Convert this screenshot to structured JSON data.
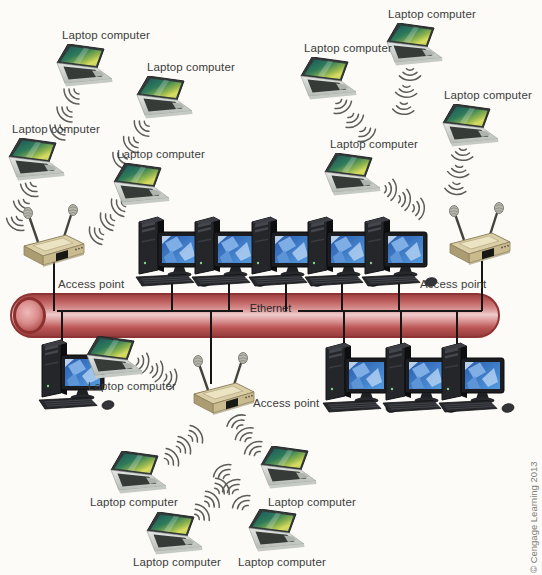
{
  "canvas": {
    "width": 542,
    "height": 575,
    "background": "#fcfbf8"
  },
  "labels": {
    "laptop": "Laptop computer",
    "access_point": "Access point",
    "ethernet": "Ethernet",
    "copyright": "© Cengage Learning 2013"
  },
  "colors": {
    "pipe_red": "#b24a4a",
    "pipe_border": "#8e3434",
    "line_black": "#161616",
    "label_text": "#3b3b3b",
    "copyright_text": "#7d7d78",
    "laptop_screen_teal": "#2f7b59",
    "monitor_screen_blue": "#3a74c4",
    "access_point_beige": "#dbcfa8"
  },
  "diagram": {
    "laptops": [
      {
        "x": 56,
        "y": 44,
        "label_x": 62,
        "label_y": 29,
        "ripples": [
          [
            58,
            86,
            180
          ],
          [
            51,
            104,
            180
          ],
          [
            44,
            122,
            180
          ]
        ]
      },
      {
        "x": 136,
        "y": 76,
        "label_x": 147,
        "label_y": 61,
        "ripples": [
          [
            128,
            118,
            182
          ],
          [
            117,
            134,
            184
          ],
          [
            106,
            150,
            186
          ]
        ]
      },
      {
        "x": 8,
        "y": 138,
        "label_x": 12,
        "label_y": 123,
        "ripples": [
          [
            16,
            180,
            170
          ],
          [
            9,
            197,
            170
          ],
          [
            2,
            214,
            170
          ]
        ]
      },
      {
        "x": 113,
        "y": 163,
        "label_x": 117,
        "label_y": 148,
        "ripples": [
          [
            104,
            197,
            190
          ],
          [
            93,
            211,
            190
          ],
          [
            82,
            225,
            190
          ]
        ]
      },
      {
        "x": 386,
        "y": 23,
        "label_x": 388,
        "label_y": 8,
        "ripples": [
          [
            398,
            66,
            135
          ],
          [
            394,
            83,
            138
          ],
          [
            391,
            100,
            140
          ]
        ]
      },
      {
        "x": 300,
        "y": 57,
        "label_x": 304,
        "label_y": 42,
        "ripples": [
          [
            332,
            97,
            100
          ],
          [
            344,
            111,
            100
          ],
          [
            356,
            125,
            100
          ]
        ]
      },
      {
        "x": 442,
        "y": 104,
        "label_x": 444,
        "label_y": 89,
        "ripples": [
          [
            450,
            146,
            140
          ],
          [
            446,
            163,
            142
          ],
          [
            443,
            180,
            144
          ]
        ]
      },
      {
        "x": 324,
        "y": 153,
        "label_x": 330,
        "label_y": 138,
        "ripples": [
          [
            382,
            178,
            50
          ],
          [
            396,
            188,
            50
          ],
          [
            410,
            197,
            50
          ]
        ]
      },
      {
        "x": 86,
        "y": 336,
        "label_x": 88,
        "label_y": 380,
        "ripples": [
          [
            134,
            352,
            60
          ],
          [
            148,
            360,
            60
          ],
          [
            162,
            368,
            60
          ]
        ]
      },
      {
        "x": 110,
        "y": 451,
        "label_x": 90,
        "label_y": 496,
        "ripples": [
          [
            162,
            444,
            10
          ],
          [
            174,
            432,
            10
          ],
          [
            186,
            421,
            10
          ]
        ]
      },
      {
        "x": 146,
        "y": 512,
        "label_x": 133,
        "label_y": 556,
        "ripples": [
          [
            192,
            499,
            5
          ],
          [
            202,
            486,
            5
          ],
          [
            212,
            473,
            5
          ]
        ]
      },
      {
        "x": 248,
        "y": 509,
        "label_x": 238,
        "label_y": 556,
        "ripples": [
          [
            228,
            488,
            280
          ],
          [
            218,
            472,
            280
          ],
          [
            209,
            457,
            280
          ]
        ]
      },
      {
        "x": 260,
        "y": 446,
        "label_x": 268,
        "label_y": 496,
        "ripples": [
          [
            240,
            434,
            280
          ],
          [
            231,
            420,
            282
          ],
          [
            223,
            407,
            284
          ]
        ]
      }
    ],
    "access_points": [
      {
        "x": 18,
        "y": 204,
        "label_x": 58,
        "label_y": 278
      },
      {
        "x": 444,
        "y": 202,
        "label_x": 420,
        "label_y": 278
      },
      {
        "x": 188,
        "y": 352,
        "label_x": 253,
        "label_y": 397
      }
    ],
    "desktops": [
      {
        "x": 133,
        "y": 213
      },
      {
        "x": 189,
        "y": 213
      },
      {
        "x": 246,
        "y": 213
      },
      {
        "x": 302,
        "y": 213
      },
      {
        "x": 359,
        "y": 213
      },
      {
        "x": 36,
        "y": 336
      },
      {
        "x": 320,
        "y": 339
      },
      {
        "x": 380,
        "y": 339
      },
      {
        "x": 436,
        "y": 339
      }
    ],
    "connectors": [
      {
        "x": 54,
        "y1": 262,
        "y2": 311
      },
      {
        "x": 482,
        "y1": 261,
        "y2": 311
      },
      {
        "x": 172,
        "y1": 283,
        "y2": 311
      },
      {
        "x": 229,
        "y1": 283,
        "y2": 311
      },
      {
        "x": 286,
        "y1": 283,
        "y2": 311
      },
      {
        "x": 342,
        "y1": 283,
        "y2": 311
      },
      {
        "x": 399,
        "y1": 283,
        "y2": 311
      },
      {
        "x": 62,
        "y1": 311,
        "y2": 344
      },
      {
        "x": 211,
        "y1": 311,
        "y2": 384
      },
      {
        "x": 344,
        "y1": 311,
        "y2": 347
      },
      {
        "x": 401,
        "y1": 311,
        "y2": 347
      },
      {
        "x": 457,
        "y1": 311,
        "y2": 347
      }
    ]
  }
}
